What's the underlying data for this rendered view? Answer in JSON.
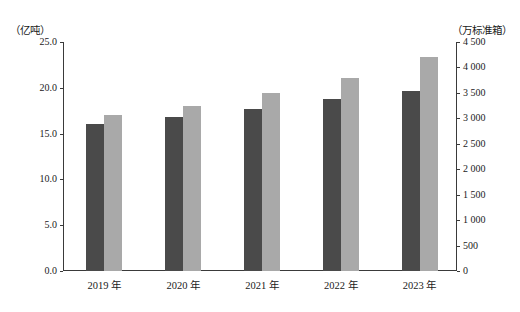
{
  "chart_data": {
    "type": "bar",
    "title": "",
    "subtitle": "",
    "categories": [
      "2019 年",
      "2020 年",
      "2021 年",
      "2022 年",
      "2023 年"
    ],
    "xlabel": "",
    "grid": false,
    "legend": "none",
    "series": [
      {
        "name": "货物吞吐量",
        "axis": "left",
        "unit": "亿吨",
        "color": "#4a4a4a",
        "values": [
          16.0,
          16.8,
          17.7,
          18.8,
          19.6
        ]
      },
      {
        "name": "集装箱吞吐量",
        "axis": "right",
        "unit": "万标准箱",
        "color": "#a9a9a9",
        "values": [
          3060,
          3240,
          3500,
          3800,
          4200
        ]
      }
    ],
    "left_axis": {
      "unit_label": "（亿吨）",
      "ylim": [
        0,
        25
      ],
      "ticks": [
        0,
        5,
        10,
        15,
        20,
        25
      ],
      "tick_labels": [
        "0.0",
        "5.0",
        "10.0",
        "15.0",
        "20.0",
        "25.0"
      ]
    },
    "right_axis": {
      "unit_label": "（万标准箱）",
      "ylim": [
        0,
        4500
      ],
      "ticks": [
        0,
        500,
        1000,
        1500,
        2000,
        2500,
        3000,
        3500,
        4000,
        4500
      ],
      "tick_labels": [
        "0",
        "500",
        "1 000",
        "1 500",
        "2 000",
        "2 500",
        "3 000",
        "3 500",
        "4 000",
        "4 500"
      ]
    }
  }
}
